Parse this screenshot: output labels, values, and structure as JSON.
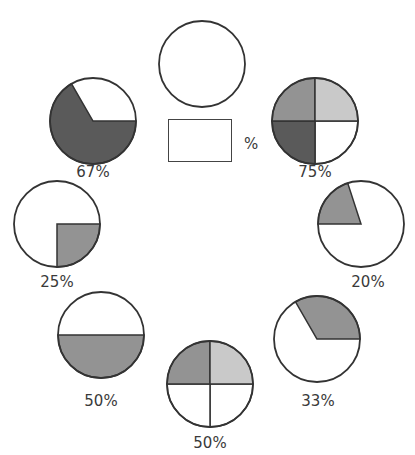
{
  "puzzle": {
    "answer_box": {
      "value": "",
      "suffix": "%"
    }
  },
  "colors": {
    "outline": "#333333",
    "fill_light": "#c9c9c9",
    "fill_mid": "#939393",
    "fill_dark": "#5a5a5a",
    "empty": "#ffffff"
  },
  "circles": [
    {
      "id": "top",
      "cx": 202,
      "cy": 64,
      "r": 43,
      "label": "",
      "type": "empty"
    },
    {
      "id": "c75",
      "cx": 315,
      "cy": 121,
      "r": 43,
      "label": "75%",
      "label_x": 315,
      "label_y": 163,
      "type": "quadrants",
      "quadrants": {
        "top_left": "mid",
        "top_right": "light",
        "bottom_left": "dark",
        "bottom_right": "empty"
      }
    },
    {
      "id": "c67",
      "cx": 93,
      "cy": 121,
      "r": 43,
      "label": "67%",
      "label_x": 93,
      "label_y": 163,
      "type": "sector",
      "shaded_from_deg": 0,
      "shaded_to_deg": 240,
      "fill": "dark"
    },
    {
      "id": "c20",
      "cx": 361,
      "cy": 224,
      "r": 43,
      "label": "20%",
      "label_x": 368,
      "label_y": 273,
      "type": "sector",
      "shaded_from_deg": 180,
      "shaded_to_deg": 252,
      "fill": "mid"
    },
    {
      "id": "c25",
      "cx": 57,
      "cy": 224,
      "r": 43,
      "label": "25%",
      "label_x": 57,
      "label_y": 273,
      "type": "sector",
      "shaded_from_deg": 0,
      "shaded_to_deg": 90,
      "fill": "mid"
    },
    {
      "id": "c33",
      "cx": 317,
      "cy": 339,
      "r": 43,
      "label": "33%",
      "label_x": 318,
      "label_y": 392,
      "type": "sector",
      "shaded_from_deg": 240,
      "shaded_to_deg": 360,
      "fill": "mid"
    },
    {
      "id": "c50a",
      "cx": 101,
      "cy": 335,
      "r": 43,
      "label": "50%",
      "label_x": 101,
      "label_y": 392,
      "type": "sector",
      "shaded_from_deg": 0,
      "shaded_to_deg": 180,
      "fill": "mid"
    },
    {
      "id": "c50b",
      "cx": 210,
      "cy": 384,
      "r": 43,
      "label": "50%",
      "label_x": 210,
      "label_y": 434,
      "type": "quadrants",
      "quadrants": {
        "top_left": "mid",
        "top_right": "light",
        "bottom_left": "empty",
        "bottom_right": "empty"
      }
    }
  ]
}
